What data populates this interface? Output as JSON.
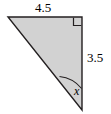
{
  "figure": {
    "type": "right-triangle-diagram",
    "background_color": "#ffffff",
    "fill_color": "#d2d2d2",
    "stroke_color": "#231f20",
    "labels": {
      "top_side": "4.5",
      "right_side": "3.5",
      "angle": "x"
    },
    "markers": {
      "right_angle": "right-angle-square",
      "angle_arc": "angle-arc"
    },
    "geometry": {
      "vertices": {
        "top_left": [
          8,
          17
        ],
        "top_right": [
          82,
          17
        ],
        "bottom_right": [
          82,
          110
        ]
      },
      "top_side_length": "4.5",
      "right_side_length": "3.5",
      "angle_at_bottom_right": "x"
    }
  }
}
